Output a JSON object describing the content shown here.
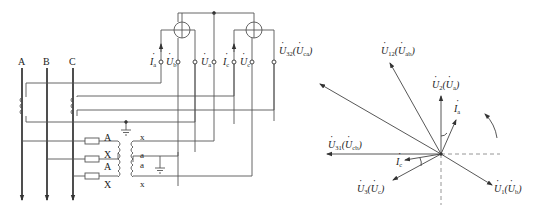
{
  "diagram": {
    "type": "wiring-and-phasor-diagram",
    "left": {
      "phase_labels": [
        "A",
        "B",
        "C"
      ],
      "pt_primary_labels": [
        "A",
        "X",
        "A",
        "X"
      ],
      "pt_secondary_labels": [
        "x",
        "a",
        "a",
        "x"
      ],
      "meter_terminals": [
        {
          "id": "Ia",
          "label": "I",
          "sub": "a"
        },
        {
          "id": "Ub",
          "label": "U",
          "sub": "b"
        },
        {
          "id": "Ua",
          "label": "U",
          "sub": "a"
        },
        {
          "id": "Ic",
          "label": "I",
          "sub": "c"
        },
        {
          "id": "Uc",
          "label": "U",
          "sub": "c"
        }
      ],
      "u32_label": {
        "main": "U",
        "sub": "32",
        "paren_main": "U",
        "paren_sub": "ca"
      }
    },
    "phasor": {
      "vectors": [
        {
          "id": "U12",
          "main": "U",
          "sub": "12",
          "paren_sub": "ab"
        },
        {
          "id": "U2",
          "main": "U",
          "sub": "2",
          "paren_sub": "a"
        },
        {
          "id": "Ia",
          "main": "I",
          "sub": "a"
        },
        {
          "id": "U31",
          "main": "U",
          "sub": "31",
          "paren_sub": "cb"
        },
        {
          "id": "Ic",
          "main": "I",
          "sub": "c"
        },
        {
          "id": "U3",
          "main": "U",
          "sub": "3",
          "paren_sub": "c"
        },
        {
          "id": "U1",
          "main": "U",
          "sub": "1",
          "paren_sub": "b"
        }
      ]
    },
    "colors": {
      "line": "#444444",
      "dashed": "#8a8a8a",
      "text": "#222222"
    }
  }
}
